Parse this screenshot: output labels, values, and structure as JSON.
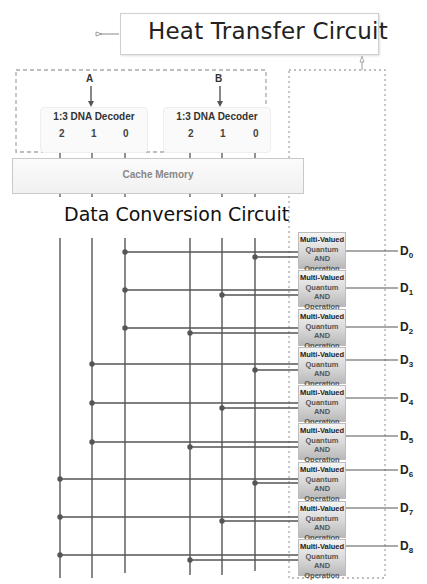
{
  "diagram": {
    "title": "Heat Transfer Circuit",
    "inputs": [
      "A",
      "B"
    ],
    "decoders": [
      {
        "label": "1:3 DNA Decoder",
        "outputs": [
          "2",
          "1",
          "0"
        ]
      },
      {
        "label": "1:3 DNA Decoder",
        "outputs": [
          "2",
          "1",
          "0"
        ]
      }
    ],
    "cache_label": "Cache Memory",
    "conversion_label": "Data Conversion Circuit",
    "gate": {
      "line1": "Multi-Valued",
      "line2": "Quantum AND",
      "line3": "Operation"
    },
    "outputs": [
      {
        "name": "D",
        "sub": "0"
      },
      {
        "name": "D",
        "sub": "1"
      },
      {
        "name": "D",
        "sub": "2"
      },
      {
        "name": "D",
        "sub": "3"
      },
      {
        "name": "D",
        "sub": "4"
      },
      {
        "name": "D",
        "sub": "5"
      },
      {
        "name": "D",
        "sub": "6"
      },
      {
        "name": "D",
        "sub": "7"
      },
      {
        "name": "D",
        "sub": "8"
      }
    ],
    "colors": {
      "line": "#555555",
      "dash": "#a8a8a8",
      "gate_top": "#f4f4f4",
      "gate_bottom": "#b9b9b9"
    }
  }
}
